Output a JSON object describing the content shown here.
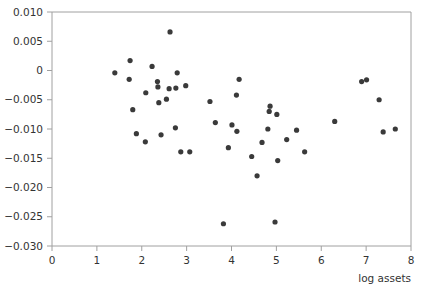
{
  "chart_data": {
    "type": "scatter",
    "title": "",
    "xlabel": "log assets",
    "ylabel": "",
    "xlim": [
      0,
      8
    ],
    "ylim": [
      -0.03,
      0.01
    ],
    "x_ticks": [
      "0",
      "1",
      "2",
      "3",
      "4",
      "5",
      "6",
      "7",
      "8"
    ],
    "y_ticks": [
      "0.010",
      "0.005",
      "0",
      "-0.005",
      "-0.010",
      "-0.015",
      "-0.020",
      "-0.025",
      "-0.030"
    ],
    "grid": false,
    "legend": null,
    "marker_color": "#3a3a3a",
    "axis_color": "#a0a0a0",
    "points": [
      {
        "x": 1.4,
        "y": -0.0004
      },
      {
        "x": 1.74,
        "y": 0.0017
      },
      {
        "x": 1.72,
        "y": -0.0015
      },
      {
        "x": 1.8,
        "y": -0.0067
      },
      {
        "x": 1.88,
        "y": -0.0108
      },
      {
        "x": 2.08,
        "y": -0.0122
      },
      {
        "x": 2.09,
        "y": -0.0038
      },
      {
        "x": 2.23,
        "y": 0.0007
      },
      {
        "x": 2.35,
        "y": -0.0019
      },
      {
        "x": 2.36,
        "y": -0.0028
      },
      {
        "x": 2.38,
        "y": -0.0055
      },
      {
        "x": 2.43,
        "y": -0.011
      },
      {
        "x": 2.55,
        "y": -0.0049
      },
      {
        "x": 2.61,
        "y": -0.0031
      },
      {
        "x": 2.63,
        "y": 0.0066
      },
      {
        "x": 2.75,
        "y": -0.0098
      },
      {
        "x": 2.76,
        "y": -0.003
      },
      {
        "x": 2.79,
        "y": -0.0004
      },
      {
        "x": 2.87,
        "y": -0.0139
      },
      {
        "x": 2.98,
        "y": -0.0026
      },
      {
        "x": 3.07,
        "y": -0.0139
      },
      {
        "x": 3.52,
        "y": -0.0053
      },
      {
        "x": 3.64,
        "y": -0.0089
      },
      {
        "x": 3.82,
        "y": -0.0262
      },
      {
        "x": 3.93,
        "y": -0.0132
      },
      {
        "x": 4.01,
        "y": -0.0093
      },
      {
        "x": 4.11,
        "y": -0.0042
      },
      {
        "x": 4.12,
        "y": -0.0104
      },
      {
        "x": 4.17,
        "y": -0.0015
      },
      {
        "x": 4.45,
        "y": -0.0147
      },
      {
        "x": 4.57,
        "y": -0.018
      },
      {
        "x": 4.68,
        "y": -0.0123
      },
      {
        "x": 4.81,
        "y": -0.01
      },
      {
        "x": 4.84,
        "y": -0.007
      },
      {
        "x": 4.86,
        "y": -0.0061
      },
      {
        "x": 4.97,
        "y": -0.0259
      },
      {
        "x": 5.01,
        "y": -0.0075
      },
      {
        "x": 5.03,
        "y": -0.0154
      },
      {
        "x": 5.23,
        "y": -0.0118
      },
      {
        "x": 5.45,
        "y": -0.0102
      },
      {
        "x": 5.63,
        "y": -0.0139
      },
      {
        "x": 6.3,
        "y": -0.0087
      },
      {
        "x": 6.9,
        "y": -0.0019
      },
      {
        "x": 7.01,
        "y": -0.0016
      },
      {
        "x": 7.29,
        "y": -0.005
      },
      {
        "x": 7.38,
        "y": -0.0105
      },
      {
        "x": 7.65,
        "y": -0.01
      }
    ]
  }
}
